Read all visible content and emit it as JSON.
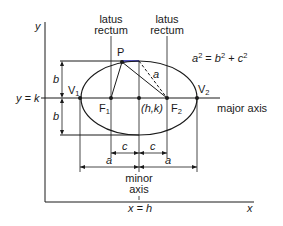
{
  "diagram": {
    "type": "ellipse-geometry",
    "axes": {
      "y_label": "y",
      "x_label": "x"
    },
    "guides": {
      "horizontal": "y = k",
      "vertical": "x = h"
    },
    "labels": {
      "latus_rectum_left_line1": "latus",
      "latus_rectum_left_line2": "rectum",
      "latus_rectum_right_line1": "latus",
      "latus_rectum_right_line2": "rectum",
      "point_P": "P",
      "vertex_1": "V",
      "vertex_1_sub": "1",
      "vertex_2": "V",
      "vertex_2_sub": "2",
      "focus_1": "F",
      "focus_1_sub": "1",
      "focus_2": "F",
      "focus_2_sub": "2",
      "center": "(h,k)",
      "major_axis": "major axis",
      "minor_axis_line1": "minor",
      "minor_axis_line2": "axis",
      "semi_major_hyp": "a",
      "b_upper": "b",
      "b_lower": "b",
      "c_left": "c",
      "c_right": "c",
      "a_left": "a",
      "a_right": "a"
    },
    "equation": {
      "a": "a",
      "a_exp": "2",
      "eq": " = ",
      "b": "b",
      "b_exp": "2",
      "plus": " + ",
      "c": "c",
      "c_exp": "2"
    },
    "colors": {
      "line": "#1a1a1a",
      "highlight": "#3a3ad0"
    }
  }
}
